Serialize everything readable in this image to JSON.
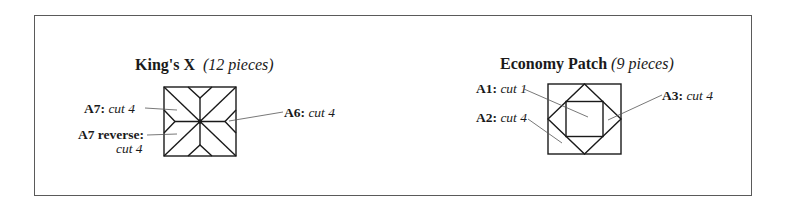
{
  "blocks": [
    {
      "name": "King's X",
      "pieces": "(12 pieces)",
      "labels": [
        {
          "id": "A7:",
          "cut": "cut 4"
        },
        {
          "id": "A7 reverse:",
          "cut": "cut 4"
        },
        {
          "id": "A6:",
          "cut": "cut 4"
        }
      ]
    },
    {
      "name": "Economy Patch",
      "pieces": "(9 pieces)",
      "labels": [
        {
          "id": "A1:",
          "cut": "cut 1"
        },
        {
          "id": "A2:",
          "cut": "cut 4"
        },
        {
          "id": "A3:",
          "cut": "cut 4"
        }
      ]
    }
  ],
  "colors": {
    "line": "#1a1a1a",
    "leader": "#555555",
    "frame": "#5a5a5a"
  }
}
